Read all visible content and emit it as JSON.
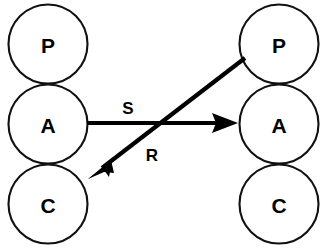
{
  "diagram": {
    "background_color": "#ffffff",
    "stroke_color": "#111111",
    "fill_color": "#ffffff",
    "arrow_color": "#000000",
    "columns": [
      {
        "name": "left-column",
        "center_x": 48,
        "nodes": [
          {
            "id": "left-p",
            "label": "P",
            "cx": 48,
            "cy": 44,
            "r": 40
          },
          {
            "id": "left-a",
            "label": "A",
            "cx": 48,
            "cy": 124,
            "r": 40
          },
          {
            "id": "left-c",
            "label": "C",
            "cx": 48,
            "cy": 204,
            "r": 40
          }
        ]
      },
      {
        "name": "right-column",
        "center_x": 279,
        "nodes": [
          {
            "id": "right-p",
            "label": "P",
            "cx": 279,
            "cy": 44,
            "r": 40
          },
          {
            "id": "right-a",
            "label": "A",
            "cx": 279,
            "cy": 124,
            "r": 40
          },
          {
            "id": "right-c",
            "label": "C",
            "cx": 279,
            "cy": 204,
            "r": 40
          }
        ]
      }
    ],
    "edges": [
      {
        "id": "edge-s",
        "label": "S",
        "from": "left-a",
        "to": "right-a",
        "label_x": 128,
        "label_y": 108,
        "x1": 88,
        "y1": 123,
        "x2": 238,
        "y2": 123,
        "direction": "left-to-right",
        "style": "straight-horizontal"
      },
      {
        "id": "edge-r",
        "label": "R",
        "from": "right-p",
        "to": "left-c",
        "label_x": 152,
        "label_y": 155,
        "x1": 245,
        "y1": 59,
        "x2": 89,
        "y2": 179,
        "direction": "right-to-left-descending",
        "style": "straight-diagonal"
      }
    ]
  }
}
